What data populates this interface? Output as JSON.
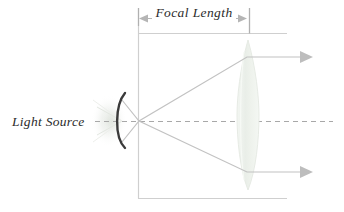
{
  "diagram": {
    "canvas": {
      "width": 344,
      "height": 212,
      "background": "#ffffff"
    },
    "labels": {
      "focal_length": "Focal Length",
      "light_source": "Light Source"
    },
    "colors": {
      "frame_line": "#cfcfcf",
      "dimension_line": "#b5b5b5",
      "optical_axis": "#a8a8a8",
      "ray": "#c2c2c2",
      "mirror": "#3a3a3a",
      "lens_fill": "#eef2ec",
      "lens_stroke": "#e2e8e0",
      "glow": "#e7eae5",
      "text": "#2b2b2b"
    },
    "geometry": {
      "optical_axis_y": 121,
      "focal_point_x": 139,
      "frame_left_x": 138,
      "frame_right_x": 287,
      "frame_top_y": 33,
      "frame_bottom_y": 198,
      "dimension_y": 18,
      "dimension_start_x": 140,
      "dimension_end_x": 246,
      "lens_center_x": 248,
      "lens_top_y": 40,
      "lens_bottom_y": 190,
      "lens_half_width": 10,
      "mirror_center_x": 120,
      "mirror_top_y": 93,
      "mirror_bottom_y": 148,
      "ray_upper_exit_y": 57,
      "ray_lower_exit_y": 172,
      "arrow_tip_x": 312
    },
    "elements": {
      "mirror_name": "concave-mirror",
      "lens_name": "converging-lens",
      "axis_name": "optical-axis",
      "upper_ray_name": "upper-light-ray",
      "lower_ray_name": "lower-light-ray"
    }
  }
}
